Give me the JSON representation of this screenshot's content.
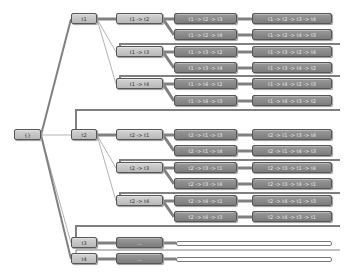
{
  "diagram": {
    "type": "permutation-tree",
    "root": {
      "label": "{}"
    },
    "level1": [
      {
        "id": "t1",
        "label": "t1"
      },
      {
        "id": "t2",
        "label": "t2"
      },
      {
        "id": "t3",
        "label": "t3"
      },
      {
        "id": "t4",
        "label": "t4"
      }
    ],
    "level2": [
      {
        "label": "t1 -> t2"
      },
      {
        "label": "t1 -> t3"
      },
      {
        "label": "t1 -> t4"
      },
      {
        "label": "t2 -> t1"
      },
      {
        "label": "t2 -> t3"
      },
      {
        "label": "t2 -> t4"
      },
      {
        "label": "..."
      },
      {
        "label": "..."
      }
    ],
    "level3": [
      {
        "label": "t1 -> t2 -> t3"
      },
      {
        "label": "t1 -> t2 -> t4"
      },
      {
        "label": "t1 -> t3 -> t2"
      },
      {
        "label": "t1 -> t3 -> t4"
      },
      {
        "label": "t1 -> t4 -> t2"
      },
      {
        "label": "t1 -> t4 -> t3"
      },
      {
        "label": "t2 -> t1 -> t3"
      },
      {
        "label": "t2 -> t1 -> t4"
      },
      {
        "label": "t2 -> t3 -> t1"
      },
      {
        "label": "t2 -> t3 -> t4"
      },
      {
        "label": "t2 -> t4 -> t1"
      },
      {
        "label": "t2 -> t4 -> t3"
      }
    ],
    "level4": [
      {
        "label": "t1 -> t2 -> t3 -> t4"
      },
      {
        "label": "t1 -> t2 -> t4 -> t3"
      },
      {
        "label": "t1 -> t3 -> t2 -> t4"
      },
      {
        "label": "t1 -> t3 -> t4 -> t2"
      },
      {
        "label": "t1 -> t4 -> t2 -> t3"
      },
      {
        "label": "t1 -> t4 -> t3 -> t2"
      },
      {
        "label": "t2 -> t1 -> t3 -> t4"
      },
      {
        "label": "t2 -> t1 -> t4 -> t3"
      },
      {
        "label": "t2 -> t3 -> t1 -> t4"
      },
      {
        "label": "t2 -> t3 -> t4 -> t1"
      },
      {
        "label": "t2 -> t4 -> t1 -> t3"
      },
      {
        "label": "t2 -> t4 -> t3 -> t1"
      }
    ],
    "colors": {
      "node_fill": "#c4c4c4",
      "node_border": "#555555",
      "dark_fill": "#8a8a8a",
      "edge": "#808080",
      "background": "#ffffff"
    }
  }
}
